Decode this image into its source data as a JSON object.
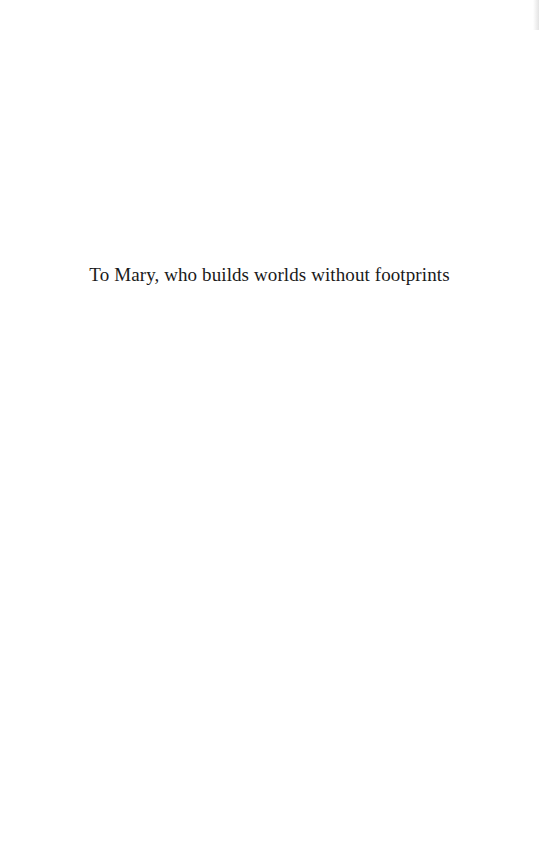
{
  "page": {
    "dedication": "To Mary, who builds worlds without footprints"
  }
}
